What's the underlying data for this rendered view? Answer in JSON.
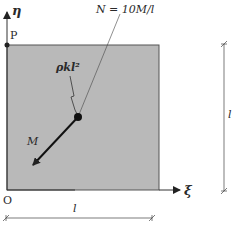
{
  "diagram": {
    "colors": {
      "plate_fill": "#b9b9b9",
      "stroke": "#333333",
      "background": "#ffffff"
    },
    "labels": {
      "eta_axis": "η",
      "xi_axis": "ξ",
      "point_p": "P",
      "origin": "O",
      "force_n": "N = 10M/l",
      "load_rho": "ρkl²",
      "moment": "M",
      "width_dim": "l",
      "height_dim": "l"
    }
  }
}
